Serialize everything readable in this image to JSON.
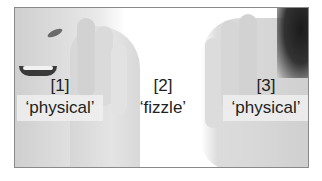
{
  "figure": {
    "labels": [
      {
        "index": "[1]",
        "word": "‘physical’",
        "position": "left",
        "boxed": true
      },
      {
        "index": "[2]",
        "word": "‘fizzle’",
        "position": "center",
        "boxed": false
      },
      {
        "index": "[3]",
        "word": "‘physical’",
        "position": "right",
        "boxed": true
      }
    ]
  }
}
